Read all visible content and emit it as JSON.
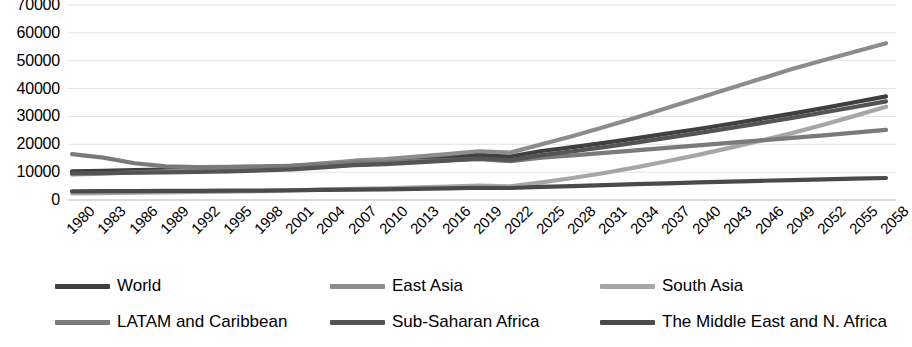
{
  "chart_data": {
    "type": "line",
    "title": "",
    "xlabel": "",
    "ylabel": "",
    "ylim": [
      0,
      70000
    ],
    "grid": true,
    "legend_position": "bottom",
    "y_ticks": [
      "0",
      "10000",
      "20000",
      "30000",
      "40000",
      "50000",
      "60000",
      "70000"
    ],
    "x": [
      1980,
      1983,
      1986,
      1989,
      1992,
      1995,
      1998,
      2001,
      2004,
      2007,
      2010,
      2013,
      2016,
      2019,
      2022,
      2025,
      2028,
      2031,
      2034,
      2037,
      2040,
      2043,
      2046,
      2049,
      2052,
      2055,
      2058
    ],
    "series": [
      {
        "name": "World",
        "color": "#3f3f3f",
        "values": [
          10300,
          10500,
          10700,
          10900,
          11100,
          11400,
          11800,
          12200,
          12900,
          13700,
          14100,
          14800,
          15400,
          16200,
          15600,
          17600,
          19000,
          20500,
          22100,
          23800,
          25500,
          27300,
          29100,
          31000,
          33000,
          35100,
          37200
        ]
      },
      {
        "name": "East Asia",
        "color": "#8c8c8c",
        "values": [
          9200,
          9500,
          9900,
          10300,
          10700,
          11200,
          11700,
          12300,
          13200,
          14100,
          14700,
          15600,
          16500,
          17500,
          17000,
          20000,
          23000,
          26200,
          29500,
          33000,
          36500,
          40000,
          43500,
          47000,
          50200,
          53200,
          56300
        ]
      },
      {
        "name": "South Asia",
        "color": "#a6a6a6",
        "values": [
          2400,
          2500,
          2600,
          2700,
          2900,
          3000,
          3200,
          3400,
          3700,
          4000,
          4200,
          4500,
          4800,
          5200,
          4900,
          6300,
          7900,
          9700,
          11700,
          13900,
          16200,
          18700,
          21300,
          24000,
          27000,
          30200,
          33500
        ]
      },
      {
        "name": "LATAM and Caribbean",
        "color": "#7a7a7a",
        "values": [
          16500,
          15200,
          13200,
          12100,
          11800,
          11900,
          12100,
          12300,
          12700,
          13300,
          13500,
          14000,
          14300,
          14700,
          13900,
          15200,
          16000,
          16900,
          17800,
          18700,
          19600,
          20500,
          21400,
          22300,
          23200,
          24200,
          25200
        ]
      },
      {
        "name": "Sub-Saharan Africa",
        "color": "#545454",
        "values": [
          9600,
          9700,
          9800,
          9900,
          10100,
          10300,
          10600,
          11000,
          11700,
          12500,
          12900,
          13500,
          14100,
          14900,
          14300,
          16100,
          17500,
          19000,
          20600,
          22300,
          24000,
          25800,
          27600,
          29500,
          31400,
          33400,
          35400
        ]
      },
      {
        "name": "The Middle East and N. Africa",
        "color": "#4a4a4a",
        "values": [
          3100,
          3150,
          3200,
          3250,
          3300,
          3350,
          3400,
          3500,
          3600,
          3750,
          3850,
          4000,
          4200,
          4400,
          4300,
          4700,
          5000,
          5350,
          5700,
          6000,
          6300,
          6600,
          6900,
          7150,
          7400,
          7650,
          7900
        ]
      }
    ]
  },
  "legend": {
    "items": [
      {
        "label": "World"
      },
      {
        "label": "East Asia"
      },
      {
        "label": "South Asia"
      },
      {
        "label": "LATAM and Caribbean"
      },
      {
        "label": "Sub-Saharan Africa"
      },
      {
        "label": "The Middle East and N. Africa"
      }
    ]
  }
}
